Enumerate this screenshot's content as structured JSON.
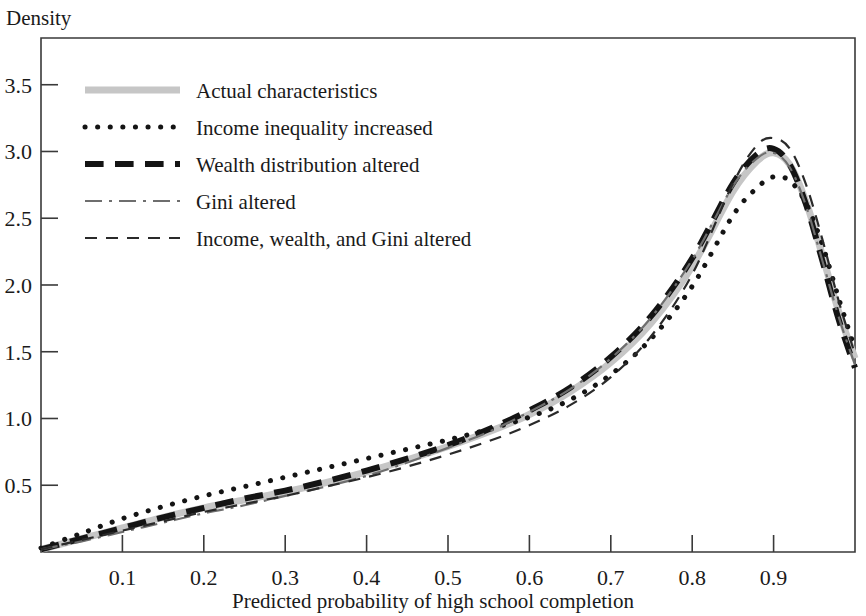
{
  "chart_data": {
    "type": "line",
    "title": "",
    "ylabel": "Density",
    "xlabel": "Predicted probability of high school completion",
    "xlim": [
      0.0,
      1.0
    ],
    "ylim": [
      0.0,
      3.85
    ],
    "grid": false,
    "legend_position": "upper-left-inside",
    "xticks": [
      "0.1",
      "0.2",
      "0.3",
      "0.4",
      "0.5",
      "0.6",
      "0.7",
      "0.8",
      "0.9"
    ],
    "xtick_values": [
      0.1,
      0.2,
      0.3,
      0.4,
      0.5,
      0.6,
      0.7,
      0.8,
      0.9
    ],
    "yticks": [
      "0.5",
      "1.0",
      "1.5",
      "2.0",
      "2.5",
      "3.0",
      "3.5"
    ],
    "ytick_values": [
      0.5,
      1.0,
      1.5,
      2.0,
      2.5,
      3.0,
      3.5
    ],
    "x": [
      0.0,
      0.05,
      0.1,
      0.15,
      0.2,
      0.25,
      0.3,
      0.35,
      0.4,
      0.45,
      0.5,
      0.55,
      0.6,
      0.65,
      0.7,
      0.75,
      0.8,
      0.85,
      0.88,
      0.9,
      0.92,
      0.94,
      0.96,
      0.98,
      1.0
    ],
    "series": [
      {
        "name": "Actual characteristics",
        "style": "solid",
        "color": "#c6c6c6",
        "width": 7,
        "values": [
          0.02,
          0.1,
          0.18,
          0.26,
          0.33,
          0.39,
          0.45,
          0.52,
          0.6,
          0.69,
          0.79,
          0.9,
          1.03,
          1.2,
          1.42,
          1.72,
          2.14,
          2.7,
          2.93,
          2.99,
          2.9,
          2.62,
          2.22,
          1.8,
          1.45
        ]
      },
      {
        "name": "Income inequality increased",
        "style": "dotted",
        "color": "#141414",
        "width": 5,
        "values": [
          0.03,
          0.14,
          0.25,
          0.34,
          0.42,
          0.49,
          0.56,
          0.63,
          0.7,
          0.77,
          0.84,
          0.92,
          1.01,
          1.14,
          1.33,
          1.6,
          1.99,
          2.52,
          2.73,
          2.81,
          2.78,
          2.61,
          2.3,
          1.9,
          1.52
        ]
      },
      {
        "name": "Wealth distribution altered",
        "style": "dashed-thick",
        "color": "#141414",
        "width": 6,
        "values": [
          0.02,
          0.1,
          0.18,
          0.26,
          0.33,
          0.4,
          0.46,
          0.53,
          0.61,
          0.7,
          0.8,
          0.92,
          1.06,
          1.23,
          1.46,
          1.77,
          2.2,
          2.76,
          2.98,
          3.02,
          2.9,
          2.6,
          2.18,
          1.74,
          1.38
        ]
      },
      {
        "name": "Gini altered",
        "style": "dashdot",
        "color": "#6e6e6e",
        "width": 2.2,
        "values": [
          0.02,
          0.08,
          0.15,
          0.22,
          0.29,
          0.35,
          0.42,
          0.49,
          0.57,
          0.67,
          0.78,
          0.9,
          1.05,
          1.22,
          1.45,
          1.76,
          2.19,
          2.74,
          2.95,
          2.99,
          2.88,
          2.59,
          2.18,
          1.76,
          1.4
        ]
      },
      {
        "name": "Income, wealth, and Gini altered",
        "style": "dashed-thin",
        "color": "#2a2a2a",
        "width": 2.2,
        "values": [
          0.02,
          0.09,
          0.16,
          0.23,
          0.3,
          0.36,
          0.42,
          0.49,
          0.56,
          0.64,
          0.73,
          0.83,
          0.95,
          1.1,
          1.31,
          1.62,
          2.08,
          2.76,
          3.05,
          3.1,
          3.02,
          2.75,
          2.34,
          1.88,
          1.48
        ]
      }
    ]
  },
  "legend": {
    "items": [
      {
        "label": "Actual characteristics"
      },
      {
        "label": "Income inequality increased"
      },
      {
        "label": "Wealth distribution altered"
      },
      {
        "label": "Gini altered"
      },
      {
        "label": "Income, wealth, and Gini altered"
      }
    ]
  }
}
